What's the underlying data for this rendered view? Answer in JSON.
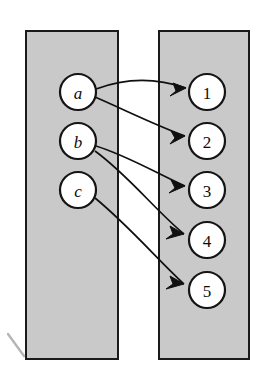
{
  "figure": {
    "type": "function-mapping-diagram",
    "title": "",
    "background_color": "#ffffff"
  },
  "colors": {
    "set_fill": "#c9c9c9",
    "set_stroke": "#1a1a1a",
    "node_fill": "#ffffff",
    "node_stroke": "#141414",
    "arrow_stroke": "#101010",
    "label_color": "#0d0d0d"
  },
  "sets": {
    "domain": {
      "name": "domain-set",
      "x": 26,
      "y": 31,
      "width": 92,
      "height": 328
    },
    "codomain": {
      "name": "codomain-set",
      "x": 159,
      "y": 31,
      "width": 90,
      "height": 328
    }
  },
  "nodes": {
    "domain_elements": [
      {
        "label": "a",
        "cx": 78,
        "cy": 92,
        "r": 18
      },
      {
        "label": "b",
        "cx": 78,
        "cy": 141,
        "r": 18
      },
      {
        "label": "c",
        "cx": 78,
        "cy": 190,
        "r": 18
      }
    ],
    "codomain_elements": [
      {
        "label": "1",
        "cx": 207,
        "cy": 92,
        "r": 18
      },
      {
        "label": "2",
        "cx": 207,
        "cy": 141,
        "r": 18
      },
      {
        "label": "3",
        "cx": 207,
        "cy": 190,
        "r": 18
      },
      {
        "label": "4",
        "cx": 207,
        "cy": 240,
        "r": 18
      },
      {
        "label": "5",
        "cx": 207,
        "cy": 290,
        "r": 18
      }
    ]
  },
  "arrows": [
    {
      "from": "a",
      "to": "1",
      "path": "M 96 89 C 130 76, 160 79, 186 88"
    },
    {
      "from": "a",
      "to": "2",
      "path": "M 95 97 C 125 110, 155 125, 185 136"
    },
    {
      "from": "b",
      "to": "3",
      "path": "M 96 146 C 128 156, 158 174, 185 186"
    },
    {
      "from": "b",
      "to": "4",
      "path": "M 95 151 C 128 175, 155 210, 184 234"
    },
    {
      "from": "c",
      "to": "5",
      "path": "M 95 198 C 128 225, 158 260, 184 284"
    }
  ],
  "arrowheads": [
    {
      "for": "a-1",
      "points": "186,88 173,83 176,91 170,96"
    },
    {
      "for": "a-2",
      "points": "185,136 171,131 175,138 170,144"
    },
    {
      "for": "b-3",
      "points": "185,186 171,180 175,188 169,193"
    },
    {
      "for": "b-4",
      "points": "184,234 170,226 173,234 166,239"
    },
    {
      "for": "c-5",
      "points": "184,284 170,276 173,284 166,289"
    }
  ],
  "annotations": {
    "corner_mark_path": "M 8 334 L 24 356"
  }
}
